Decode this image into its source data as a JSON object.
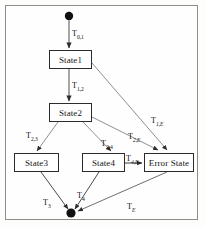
{
  "diagram": {
    "frame": {
      "border_color": "#8d8d8d",
      "background": "#fefefe"
    },
    "colors": {
      "box_border": "#2b2b2b",
      "box_fill": "#ffffff",
      "edge": "#6e6e6e",
      "edge_dark": "#4a4a4a",
      "node_fill": "#111111",
      "text": "#151515"
    },
    "nodes": [
      {
        "id": "start",
        "type": "initial-node",
        "label": "",
        "cx": 69,
        "cy": 16,
        "r": 4.2
      },
      {
        "id": "state1",
        "type": "state",
        "label": "State1",
        "x": 49,
        "y": 50,
        "w": 43,
        "h": 19
      },
      {
        "id": "state2",
        "type": "state",
        "label": "State2",
        "x": 49,
        "y": 103,
        "w": 43,
        "h": 19
      },
      {
        "id": "state3",
        "type": "state",
        "label": "State3",
        "x": 14,
        "y": 153,
        "w": 45,
        "h": 19
      },
      {
        "id": "state4",
        "type": "state",
        "label": "State4",
        "x": 82,
        "y": 153,
        "w": 43,
        "h": 19
      },
      {
        "id": "error",
        "type": "state",
        "label": "Error State",
        "x": 144,
        "y": 153,
        "w": 50,
        "h": 19
      },
      {
        "id": "final",
        "type": "final-node",
        "label": "",
        "cx": 71,
        "cy": 213,
        "r": 4.6
      }
    ],
    "transitions": [
      {
        "id": "t01",
        "from": "start",
        "to": "state1",
        "label": "T",
        "sub": "0,1",
        "sub_italic": false,
        "label_x": 72,
        "label_y": 30
      },
      {
        "id": "t12",
        "from": "state1",
        "to": "state2",
        "label": "T",
        "sub": "1,2",
        "sub_italic": false,
        "label_x": 72,
        "label_y": 82
      },
      {
        "id": "t1E",
        "from": "state1",
        "to": "error",
        "label": "T",
        "sub": "1,E",
        "sub_italic": true,
        "label_x": 151,
        "label_y": 117
      },
      {
        "id": "t23",
        "from": "state2",
        "to": "state3",
        "label": "T",
        "sub": "2,3",
        "sub_italic": false,
        "label_x": 26,
        "label_y": 132
      },
      {
        "id": "t24",
        "from": "state2",
        "to": "state4",
        "label": "T",
        "sub": "2,4",
        "sub_italic": false,
        "label_x": 101,
        "label_y": 140
      },
      {
        "id": "t2E",
        "from": "state2",
        "to": "error",
        "label": "T",
        "sub": "2,E",
        "sub_italic": true,
        "label_x": 128,
        "label_y": 133
      },
      {
        "id": "t4E",
        "from": "state4",
        "to": "error",
        "label": "T",
        "sub": "4,E",
        "sub_italic": true,
        "label_x": 126,
        "label_y": 155
      },
      {
        "id": "t3",
        "from": "state3",
        "to": "final",
        "label": "T",
        "sub": "3",
        "sub_italic": false,
        "label_x": 43,
        "label_y": 199
      },
      {
        "id": "t4",
        "from": "state4",
        "to": "final",
        "label": "T",
        "sub": "4",
        "sub_italic": false,
        "label_x": 77,
        "label_y": 192
      },
      {
        "id": "tE",
        "from": "error",
        "to": "final",
        "label": "T",
        "sub": "E",
        "sub_italic": true,
        "label_x": 127,
        "label_y": 203
      }
    ]
  }
}
